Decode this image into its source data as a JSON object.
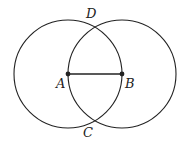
{
  "diagram": {
    "points": {
      "A": {
        "label": "A",
        "x": 68,
        "y": 74
      },
      "B": {
        "label": "B",
        "x": 122,
        "y": 74
      },
      "C": {
        "label": "C",
        "x": 95,
        "y": 121
      },
      "D": {
        "label": "D",
        "x": 95,
        "y": 27
      }
    },
    "circles": [
      {
        "center": "A",
        "radius": 54
      },
      {
        "center": "B",
        "radius": 54
      }
    ],
    "segments": [
      [
        "A",
        "B"
      ]
    ],
    "colors": {
      "stroke": "#222222",
      "background": "#ffffff"
    }
  }
}
